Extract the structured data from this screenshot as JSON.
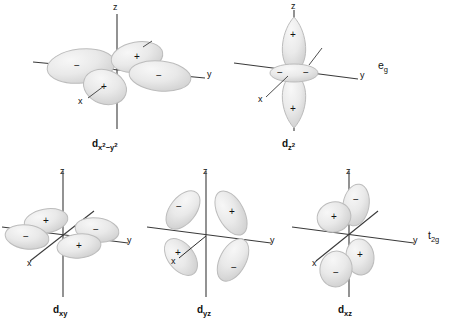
{
  "figure": {
    "background_color": "#ffffff",
    "lobe_fill": "#e9e9e9",
    "lobe_stroke": "#b9b9b9",
    "axis_color": "#3a3a3a"
  },
  "orbitals": [
    {
      "id": "dx2-y2",
      "name_base": "d",
      "name_sub": "x",
      "name_sub_sup": "2",
      "name_sub_2": "−y",
      "name_sub_2_sup": "2",
      "name_plain": "dx2−y2",
      "axes": {
        "z": "z",
        "y": "y",
        "x": "x"
      },
      "signs": [
        "−",
        "+",
        "+",
        "−"
      ],
      "sign_layout": [
        "left",
        "upper-right",
        "lower-left",
        "right"
      ]
    },
    {
      "id": "dz2",
      "name_base": "d",
      "name_sub": "z",
      "name_sub_sup": "2",
      "name_plain": "dz2",
      "axes": {
        "z": "z",
        "y": "y",
        "x": "x"
      },
      "signs": [
        "+",
        "−",
        "−",
        "+"
      ],
      "sign_layout": [
        "top",
        "torus-left",
        "torus-right",
        "bottom"
      ]
    },
    {
      "id": "dxy",
      "name_base": "d",
      "name_sub": "xy",
      "name_plain": "dxy",
      "axes": {
        "z": "z",
        "y": "y",
        "x": "x"
      },
      "signs": [
        "+",
        "−",
        "−",
        "+"
      ],
      "sign_layout": [
        "upper-left",
        "left",
        "right",
        "lower-right"
      ]
    },
    {
      "id": "dyz",
      "name_base": "d",
      "name_sub": "yz",
      "name_plain": "dyz",
      "axes": {
        "z": "z",
        "y": "y",
        "x": "x"
      },
      "signs": [
        "−",
        "+",
        "+",
        "−"
      ],
      "sign_layout": [
        "upper-left",
        "upper-right",
        "lower-left",
        "lower-right"
      ]
    },
    {
      "id": "dxz",
      "name_base": "d",
      "name_sub": "xz",
      "name_plain": "dxz",
      "axes": {
        "z": "z",
        "y": "y",
        "x": "x"
      },
      "signs": [
        "+",
        "−",
        "+",
        "−"
      ],
      "sign_layout": [
        "upper-left",
        "upper-right",
        "lower-right",
        "lower-left"
      ]
    }
  ],
  "sets": {
    "eg": {
      "base": "e",
      "sub": "g",
      "plain": "eg"
    },
    "t2g": {
      "base": "t",
      "sub": "2g",
      "plain": "t2g"
    }
  }
}
